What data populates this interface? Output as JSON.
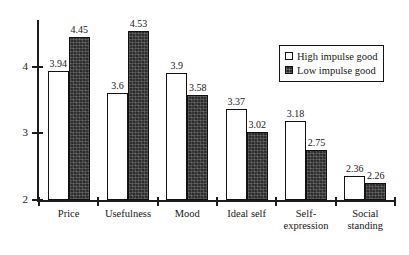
{
  "chart_data": {
    "type": "bar",
    "title": "",
    "subtitle": "",
    "xlabel": "",
    "ylabel": "",
    "ylim": [
      2,
      4.7
    ],
    "yticks": [
      2,
      3,
      4
    ],
    "ytick_labels": [
      "2",
      "3",
      "4"
    ],
    "grid": false,
    "legend_position": "top-right",
    "categories": [
      "Price",
      "Usefulness",
      "Mood",
      "Ideal self",
      "Self-expression",
      "Social standing"
    ],
    "category_lines": [
      [
        "Price"
      ],
      [
        "Usefulness"
      ],
      [
        "Mood"
      ],
      [
        "Ideal self"
      ],
      [
        "Self-",
        "expression"
      ],
      [
        "Social",
        "standing"
      ]
    ],
    "series": [
      {
        "name": "High impulse good",
        "style": "white-filled-outlined",
        "color": "#ffffff",
        "values": [
          3.94,
          3.6,
          3.9,
          3.37,
          3.18,
          2.36
        ],
        "labels": [
          "3.94",
          "3.6",
          "3.9",
          "3.37",
          "3.18",
          "2.36"
        ]
      },
      {
        "name": "Low impulse good",
        "style": "dark-textured",
        "color": "#2b2b2b",
        "values": [
          4.45,
          4.53,
          3.58,
          3.02,
          2.75,
          2.26
        ],
        "labels": [
          "4.45",
          "4.53",
          "3.58",
          "3.02",
          "2.75",
          "2.26"
        ]
      }
    ]
  },
  "legend": {
    "entries": [
      {
        "label": "High impulse good"
      },
      {
        "label": "Low impulse good"
      }
    ]
  }
}
